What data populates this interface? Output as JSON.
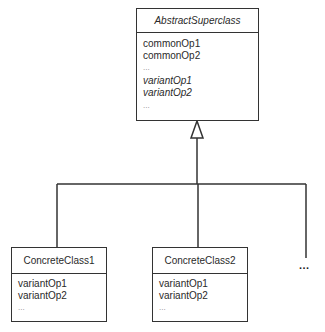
{
  "diagram": {
    "type": "UML class diagram",
    "superclass": {
      "name": "AbstractSuperclass",
      "name_italic": true,
      "operations": [
        {
          "label": "commonOp1",
          "italic": false
        },
        {
          "label": "commonOp2",
          "italic": false
        },
        {
          "label": "...",
          "italic": false
        },
        {
          "label": "variantOp1",
          "italic": true
        },
        {
          "label": "variantOp2",
          "italic": true
        },
        {
          "label": "...",
          "italic": false
        }
      ]
    },
    "subclasses": [
      {
        "name": "ConcreteClass1",
        "operations": [
          {
            "label": "variantOp1"
          },
          {
            "label": "variantOp2"
          },
          {
            "label": "..."
          }
        ]
      },
      {
        "name": "ConcreteClass2",
        "operations": [
          {
            "label": "variantOp1"
          },
          {
            "label": "variantOp2"
          },
          {
            "label": "..."
          }
        ]
      }
    ],
    "more_subclasses_label": "...",
    "relationship": "generalization (inheritance)",
    "line_color": "#333333"
  }
}
